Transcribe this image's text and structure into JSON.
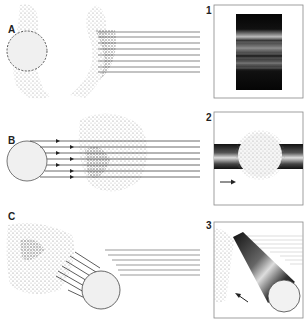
{
  "figure": {
    "rows": [
      {
        "label": "A",
        "panel_number": "1",
        "description": "dashed circle cross-section, parallel lines exiting right"
      },
      {
        "label": "B",
        "panel_number": "2",
        "description": "solid circle with arrowed parallel lines passing through stippled sphere"
      },
      {
        "label": "C",
        "panel_number": "3",
        "description": "cylinder at angle with arrowed lines into stippled mass"
      }
    ],
    "colors": {
      "line": "#555555",
      "stipple": "#6e6e6e",
      "panel_border": "#888888",
      "dark_band": "#111111",
      "circle_fill": "#efefef"
    }
  }
}
